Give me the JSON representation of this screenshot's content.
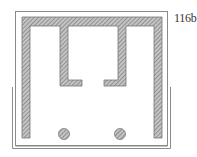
{
  "figure": {
    "label": "116b",
    "colors": {
      "line": "#8a8a8a",
      "hatch_fill": "#b8b8b8",
      "hatch_line": "#6e6e6e",
      "background": "#ffffff"
    },
    "components": [
      {
        "name": "outer-frame",
        "type": "thin-rectangle"
      },
      {
        "name": "tray",
        "type": "u-shaped-double-line"
      },
      {
        "name": "top-bar",
        "type": "hatched-bar"
      },
      {
        "name": "left-leg",
        "type": "hatched-bar"
      },
      {
        "name": "right-leg",
        "type": "hatched-bar"
      },
      {
        "name": "inner-left-hook",
        "type": "hatched-L"
      },
      {
        "name": "inner-right-hook",
        "type": "hatched-L"
      },
      {
        "name": "left-post",
        "type": "hatched-circle"
      },
      {
        "name": "right-post",
        "type": "hatched-circle"
      }
    ]
  }
}
